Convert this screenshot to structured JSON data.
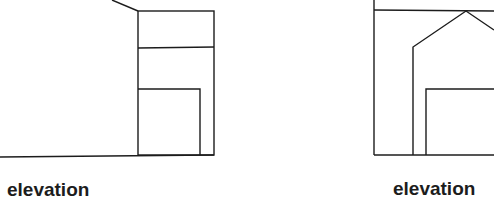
{
  "drawings": [
    {
      "id": "left",
      "label": "elevation"
    },
    {
      "id": "right",
      "label": "elevation"
    }
  ],
  "colors": {
    "line": "#1c1c1c",
    "background": "#ffffff"
  }
}
